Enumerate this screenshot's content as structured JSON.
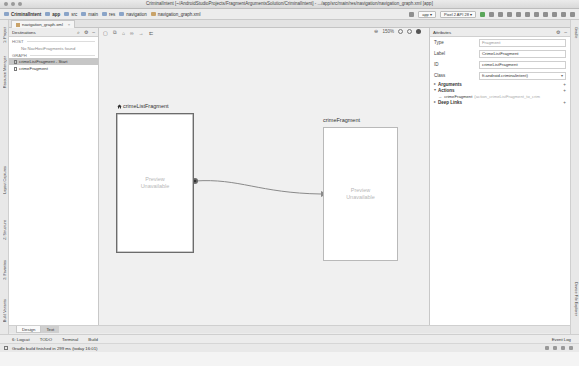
{
  "window": {
    "title": "CriminalIntent [~/AndroidStudioProjects/FragmentArgumentsSolution/CriminalIntent] - .../app/src/main/res/navigation/navigation_graph.xml [app]"
  },
  "breadcrumbs": [
    {
      "label": "CriminalIntent",
      "bold": true
    },
    {
      "label": "app",
      "bold": true
    },
    {
      "label": "src"
    },
    {
      "label": "main"
    },
    {
      "label": "res"
    },
    {
      "label": "navigation"
    },
    {
      "label": "navigation_graph.xml"
    }
  ],
  "toolbar": {
    "run_config": "app",
    "device": "Pixel 2 API 28"
  },
  "editor_tabs": [
    {
      "label": "navigation_graph.xml",
      "close": "×"
    }
  ],
  "left_strip": {
    "tabs": [
      "1: Project",
      "Resource Manager",
      "Layout Captures",
      "Z: Structure",
      "2: Favorites",
      "Build Variants"
    ]
  },
  "right_strip": {
    "tabs": [
      "Gradle",
      "Device File Explorer"
    ]
  },
  "destinations_panel": {
    "title": "Destinations",
    "host_section": "HOST",
    "host_note": "No NavHostFragments found",
    "graph_section": "GRAPH",
    "items": [
      {
        "label": "crimeListFragment - Start",
        "selected": true
      },
      {
        "label": "crimeFragment",
        "selected": false
      }
    ]
  },
  "canvas": {
    "zoom_level": "150%",
    "nodes": [
      {
        "id": "crimeListFragment",
        "label": "crimeListFragment",
        "is_start": true,
        "preview_text_1": "Preview",
        "preview_text_2": "Unavailable"
      },
      {
        "id": "crimeFragment",
        "label": "crimeFragment",
        "is_start": false,
        "preview_text_1": "Preview",
        "preview_text_2": "Unavailable"
      }
    ],
    "action": {
      "from": "crimeListFragment",
      "to": "crimeFragment"
    }
  },
  "attributes_panel": {
    "title": "Attributes",
    "fields": [
      {
        "key": "Type",
        "value": "Fragment",
        "muted": true
      },
      {
        "key": "Label",
        "value": "CrimeListFragment",
        "muted": false
      },
      {
        "key": "ID",
        "value": "crimeListFragment",
        "muted": false
      },
      {
        "key": "Class",
        "value": "ft.android.criminalintent)",
        "dropdown": true
      }
    ],
    "groups": {
      "arguments": "Arguments",
      "actions": "Actions",
      "deep_links": "Deep Links"
    },
    "action_items": [
      {
        "target": "crimeFragment",
        "id": "(action_crimeListFragment_to_crim"
      }
    ]
  },
  "design_tabs": [
    {
      "label": "Design",
      "active": true
    },
    {
      "label": "Text",
      "active": false
    }
  ],
  "tool_windows": {
    "items": [
      "6: Logcat",
      "TODO",
      "Terminal",
      "Build"
    ],
    "event_log": "Event Log"
  },
  "status": {
    "message": "Gradle build finished in 299 ms (today 16:01)"
  },
  "colors": {
    "canvas_bg": "#f0f0f0",
    "selected_item": "#c6c6c6",
    "start_border": "#6c6c6c",
    "connector": "#8a8a8a"
  }
}
